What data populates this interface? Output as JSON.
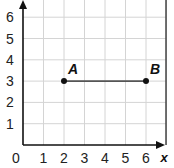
{
  "chart_data": {
    "type": "scatter",
    "title": "",
    "xlabel": "x",
    "ylabel": "y",
    "xlim": [
      0,
      6.8
    ],
    "ylim": [
      0,
      6.8
    ],
    "grid": true,
    "x_ticks": [
      "0",
      "1",
      "2",
      "3",
      "4",
      "5",
      "6"
    ],
    "y_ticks": [
      "1",
      "2",
      "3",
      "4",
      "5",
      "6"
    ],
    "points": [
      {
        "label": "A",
        "x": 2,
        "y": 3
      },
      {
        "label": "B",
        "x": 6,
        "y": 3
      }
    ],
    "segments": [
      {
        "from": "A",
        "to": "B",
        "x1": 2,
        "y1": 3,
        "x2": 6,
        "y2": 3
      }
    ]
  },
  "colors": {
    "grid": "#d4d4d4",
    "axis": "#111111",
    "segment": "#555555",
    "point": "#111111",
    "border": "#444444"
  }
}
